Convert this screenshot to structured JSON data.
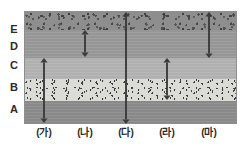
{
  "figure": {
    "frame": {
      "x": 24,
      "y": 11,
      "width": 213,
      "height": 113
    },
    "border_color": "#8e8e8e"
  },
  "layers": [
    {
      "id": "E",
      "label": "E",
      "top": 0,
      "height": 18,
      "texture": "coarse",
      "color": "#8e8e8e",
      "label_y": 30
    },
    {
      "id": "D",
      "label": "D",
      "top": 18,
      "height": 28,
      "texture": "mid",
      "color": "#9b9b9b",
      "label_y": 47
    },
    {
      "id": "C",
      "label": "C",
      "top": 46,
      "height": 21,
      "texture": "light",
      "color": "#b4b4b4",
      "label_y": 66
    },
    {
      "id": "B",
      "label": "B",
      "top": 67,
      "height": 22,
      "texture": "speckle",
      "color": "#dcdcd6",
      "label_y": 88
    },
    {
      "id": "A",
      "label": "A",
      "top": 89,
      "height": 24,
      "texture": "dark",
      "color": "#8f8f8f",
      "label_y": 110
    }
  ],
  "arrows": [
    {
      "id": "ga",
      "label": "(가)",
      "x": 44,
      "top": 58,
      "bottom": 123,
      "spans": "C-B-A",
      "color": "#3c3c3c"
    },
    {
      "id": "na",
      "label": "(나)",
      "x": 85,
      "top": 30,
      "bottom": 57,
      "spans": "D",
      "color": "#3c3c3c"
    },
    {
      "id": "da",
      "label": "(다)",
      "x": 126,
      "top": 12,
      "bottom": 124,
      "spans": "E-D-C-B-A",
      "color": "#3c3c3c"
    },
    {
      "id": "ra",
      "label": "(라)",
      "x": 167,
      "top": 58,
      "bottom": 100,
      "spans": "C-B",
      "color": "#3c3c3c"
    },
    {
      "id": "ma",
      "label": "(마)",
      "x": 209,
      "top": 12,
      "bottom": 58,
      "spans": "E-D",
      "color": "#3c3c3c"
    }
  ],
  "colors": {
    "background": "#ffffff",
    "text": "#2b2b2b",
    "arrow": "#3c3c3c"
  }
}
